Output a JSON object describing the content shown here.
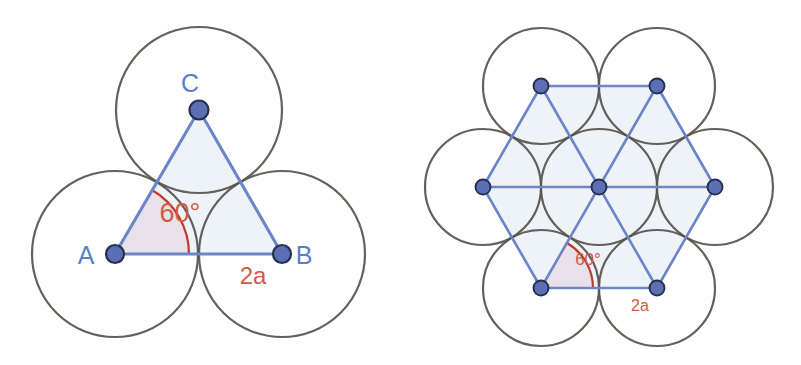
{
  "page": {
    "background_color": "#ffffff",
    "width": 801,
    "height": 365
  },
  "colors": {
    "circle_outline": "#57534e",
    "lattice_line": "#6c84c8",
    "vertex_fill": "#5c6fb4",
    "vertex_stroke": "#23304f",
    "polygon_fill": "#eef3f8",
    "angle_arc": "#c0392b",
    "measure_text": "#cf5b46",
    "point_label_text": "#5b7fc7"
  },
  "figures": [
    {
      "id": "left-figure",
      "name": "three-tangent-circles-equilateral-triangle",
      "caption_labels": {
        "vertex_a": "A",
        "vertex_b": "B",
        "vertex_c": "C",
        "angle": "60°",
        "side_length": "2a"
      },
      "geometry": {
        "circle_radius": 83,
        "triangle_side": 167,
        "vertices": [
          {
            "label": "A",
            "x": 115,
            "y": 254
          },
          {
            "label": "B",
            "x": 282,
            "y": 254
          },
          {
            "label": "C",
            "x": 199,
            "y": 110
          }
        ],
        "circle_centers": [
          {
            "x": 115,
            "y": 254
          },
          {
            "x": 282,
            "y": 254
          },
          {
            "x": 199,
            "y": 110
          }
        ],
        "angle_vertex": "A",
        "angle_degrees": 60,
        "angle_arc_radius": 74
      },
      "label_positions": {
        "a": {
          "x": 86,
          "y": 264
        },
        "b": {
          "x": 296,
          "y": 264
        },
        "c": {
          "x": 190,
          "y": 92
        },
        "angle": {
          "x": 156,
          "y": 221
        },
        "side": {
          "x": 240,
          "y": 282
        }
      }
    },
    {
      "id": "right-figure",
      "name": "seven-circle-hexagonal-packing-hexagram",
      "caption_labels": {
        "angle": "60°",
        "side_length": "2a"
      },
      "geometry": {
        "circle_radius": 58,
        "lattice_spacing": 116,
        "center": {
          "x": 599,
          "y": 187
        },
        "circle_centers": [
          {
            "x": 599,
            "y": 187
          },
          {
            "x": 483,
            "y": 187
          },
          {
            "x": 715,
            "y": 187
          },
          {
            "x": 541,
            "y": 86
          },
          {
            "x": 657,
            "y": 86
          },
          {
            "x": 541,
            "y": 288
          },
          {
            "x": 657,
            "y": 288
          }
        ],
        "hexagon_vertices": [
          {
            "x": 483,
            "y": 187
          },
          {
            "x": 541,
            "y": 86
          },
          {
            "x": 657,
            "y": 86
          },
          {
            "x": 715,
            "y": 187
          },
          {
            "x": 657,
            "y": 288
          },
          {
            "x": 541,
            "y": 288
          }
        ],
        "angle_vertex": {
          "x": 541,
          "y": 288
        },
        "angle_degrees": 60,
        "angle_arc_radius": 52
      },
      "label_positions": {
        "angle": {
          "x": 571,
          "y": 263
        },
        "side": {
          "x": 625,
          "y": 311
        }
      }
    }
  ]
}
